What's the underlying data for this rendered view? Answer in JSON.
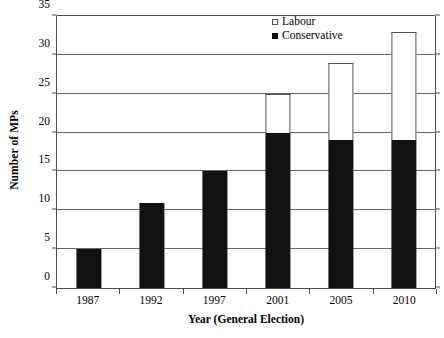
{
  "chart_data": {
    "type": "bar",
    "subtype": "stacked-bar",
    "title": "",
    "xlabel": "Year (General Election)",
    "ylabel": "Number of MPs",
    "categories": [
      "1987",
      "1992",
      "1997",
      "2001",
      "2005",
      "2010"
    ],
    "series": [
      {
        "name": "Conservative",
        "color": "#111111",
        "values": [
          5,
          11,
          15,
          20,
          19,
          19
        ]
      },
      {
        "name": "Labour",
        "color": "#ffffff",
        "values": [
          0,
          0,
          0,
          5,
          10,
          14
        ]
      }
    ],
    "totals": [
      5,
      11,
      15,
      25,
      29,
      33
    ],
    "ylim": [
      0,
      35
    ],
    "ytick_step": 5,
    "yticks": [
      "0",
      "5",
      "10",
      "15",
      "20",
      "25",
      "30",
      "35"
    ],
    "grid": true,
    "grid_axis": "y",
    "legend_position": "top-right",
    "legend": [
      {
        "label": "Labour",
        "marker": "open-square"
      },
      {
        "label": "Conservative",
        "marker": "filled-square"
      }
    ]
  },
  "axes": {
    "y_title": "Number of MPs",
    "x_title": "Year (General Election)"
  }
}
